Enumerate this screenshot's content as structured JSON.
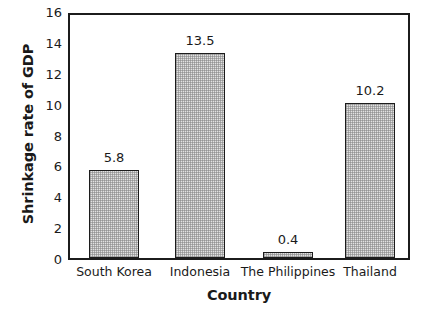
{
  "chart_data": {
    "type": "bar",
    "title": "",
    "subtitle": "",
    "xlabel": "Country",
    "ylabel": "Shrinkage rate of GDP",
    "categories": [
      "South Korea",
      "Indonesia",
      "The Philippines",
      "Thailand"
    ],
    "values": [
      5.8,
      13.5,
      0.4,
      10.2
    ],
    "value_labels": [
      "5.8",
      "13.5",
      "0.4",
      "10.2"
    ],
    "ylim": [
      0,
      16
    ],
    "yticks": [
      16,
      14,
      12,
      10,
      8,
      6,
      4,
      2,
      0
    ],
    "ytick_labels": [
      "16",
      "14",
      "12",
      "10",
      "8",
      "6",
      "4",
      "2",
      "0"
    ],
    "grid": false,
    "legend": null,
    "legend_position": "none",
    "bar_fill_color": "#e2e2e2",
    "bar_edge_color": "#1c1c1c",
    "axis_color": "#1c1c1c",
    "background_color": "#ffffff",
    "text_color": "#1a1a1a"
  }
}
